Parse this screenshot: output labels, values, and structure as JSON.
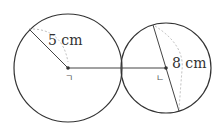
{
  "diagram": {
    "left_circle": {
      "center": [
        68,
        68
      ],
      "radius": 54,
      "radius_label": "5 cm",
      "center_label": "ㄱ"
    },
    "right_circle": {
      "center": [
        165,
        68
      ],
      "radius": 45,
      "diameter_label": "8 cm",
      "center_label": "ㄴ"
    },
    "connector": "segment joining the two centers through the tangent point",
    "colors": {
      "stroke": "#333333",
      "guide": "#aaaaaa"
    }
  }
}
